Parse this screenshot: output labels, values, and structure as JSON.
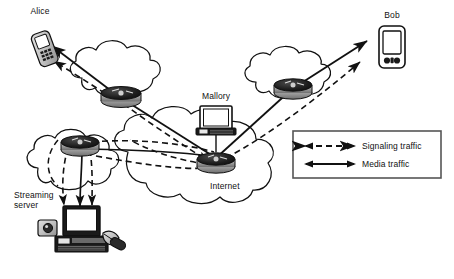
{
  "diagram": {
    "type": "network-topology"
  },
  "nodes": [
    {
      "id": "alice",
      "label": "Alice",
      "icon": "mobile-phone-icon",
      "x": 30,
      "y": 48
    },
    {
      "id": "bob",
      "label": "Bob",
      "icon": "smartphone-icon",
      "x": 385,
      "y": 45
    },
    {
      "id": "mallory",
      "label": "Mallory",
      "icon": "laptop-icon",
      "x": 216,
      "y": 110
    },
    {
      "id": "server",
      "label": "Streaming\nserver",
      "icon": "desktop-computer-icon",
      "x": 78,
      "y": 240
    }
  ],
  "node_labels": {
    "alice": "Alice",
    "bob": "Bob",
    "mallory": "Mallory",
    "server_line1": "Streaming",
    "server_line2": "server",
    "internet": "Internet"
  },
  "clouds": [
    {
      "id": "cloud-alice",
      "name": "access-network-cloud-left"
    },
    {
      "id": "cloud-bob",
      "name": "access-network-cloud-right"
    },
    {
      "id": "cloud-server",
      "name": "access-network-cloud-bottom-left"
    },
    {
      "id": "cloud-internet",
      "name": "internet-core-cloud",
      "label": "Internet"
    }
  ],
  "routers": [
    {
      "id": "router-alice",
      "name": "router-near-alice"
    },
    {
      "id": "router-bob",
      "name": "router-near-bob"
    },
    {
      "id": "router-server",
      "name": "router-near-streaming-server"
    },
    {
      "id": "router-internet",
      "name": "router-internet-core"
    }
  ],
  "legend": {
    "items": [
      {
        "id": "signaling",
        "label": "Signaling traffic",
        "style": "dashed",
        "arrows": "both"
      },
      {
        "id": "media",
        "label": "Media traffic",
        "style": "solid",
        "arrows": "both"
      }
    ]
  },
  "colors": {
    "line": "#111111",
    "text": "#111111",
    "device_fill": "#cfcfcf",
    "device_dark": "#1a1a1a",
    "legend_border": "#555555",
    "background": "#ffffff"
  }
}
